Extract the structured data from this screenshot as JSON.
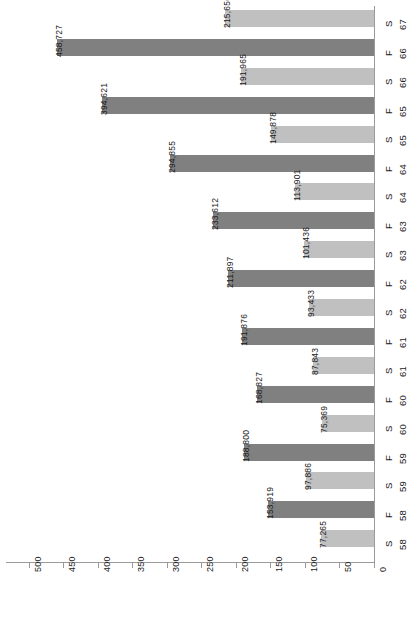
{
  "chart_data": {
    "type": "bar",
    "orientation": "horizontal-rotated",
    "title": "",
    "subtitle": "",
    "xlabel": "",
    "ylabel": "",
    "xlim": [
      0,
      500
    ],
    "grid": false,
    "legend": "none",
    "axis_ticks": [
      "0",
      "50",
      "100",
      "150",
      "200",
      "250",
      "300",
      "350",
      "400",
      "450",
      "500"
    ],
    "axis_tick_values": [
      0,
      50,
      100,
      150,
      200,
      250,
      300,
      350,
      400,
      450,
      500
    ],
    "axis_units": "thousands",
    "categories": [
      {
        "term": "S",
        "year": "67"
      },
      {
        "term": "F",
        "year": "66"
      },
      {
        "term": "S",
        "year": "66"
      },
      {
        "term": "F",
        "year": "65"
      },
      {
        "term": "S",
        "year": "65"
      },
      {
        "term": "F",
        "year": "64"
      },
      {
        "term": "S",
        "year": "64"
      },
      {
        "term": "F",
        "year": "63"
      },
      {
        "term": "S",
        "year": "63"
      },
      {
        "term": "F",
        "year": "62"
      },
      {
        "term": "S",
        "year": "62"
      },
      {
        "term": "F",
        "year": "61"
      },
      {
        "term": "S",
        "year": "61"
      },
      {
        "term": "F",
        "year": "60"
      },
      {
        "term": "S",
        "year": "60"
      },
      {
        "term": "F",
        "year": "59"
      },
      {
        "term": "S",
        "year": "59"
      },
      {
        "term": "F",
        "year": "58"
      },
      {
        "term": "S",
        "year": "58"
      }
    ],
    "bars": [
      {
        "category": "S 67",
        "series": "light",
        "value": 215.656,
        "label": "215,656"
      },
      {
        "category": "F 66",
        "series": "dark",
        "value": 458.727,
        "label": "458,727"
      },
      {
        "category": "S 66",
        "series": "light",
        "value": 191.965,
        "label": "191,965"
      },
      {
        "category": "F 65",
        "series": "dark",
        "value": 394.621,
        "label": "394,621"
      },
      {
        "category": "S 65",
        "series": "light",
        "value": 149.878,
        "label": "149,878"
      },
      {
        "category": "F 64",
        "series": "dark",
        "value": 294.855,
        "label": "294,855"
      },
      {
        "category": "S 64",
        "series": "light",
        "value": 113.901,
        "label": "113,901"
      },
      {
        "category": "F 63",
        "series": "dark",
        "value": 233.612,
        "label": "233,612"
      },
      {
        "category": "S 63",
        "series": "light",
        "value": 101.436,
        "label": "101,436"
      },
      {
        "category": "F 62",
        "series": "dark",
        "value": 211.897,
        "label": "211,897"
      },
      {
        "category": "S 62",
        "series": "light",
        "value": 93.433,
        "label": "93,433"
      },
      {
        "category": "F 61",
        "series": "dark",
        "value": 191.876,
        "label": "191,876"
      },
      {
        "category": "S 61",
        "series": "light",
        "value": 87.843,
        "label": "87,843"
      },
      {
        "category": "F 60",
        "series": "dark",
        "value": 168.827,
        "label": "168,827"
      },
      {
        "category": "S 60",
        "series": "light",
        "value": 75.369,
        "label": "75,369"
      },
      {
        "category": "F 59",
        "series": "dark",
        "value": 188.8,
        "label": "188,800"
      },
      {
        "category": "S 59",
        "series": "light",
        "value": 97.886,
        "label": "97,886"
      },
      {
        "category": "F 58",
        "series": "dark",
        "value": 153.919,
        "label": "153,919"
      },
      {
        "category": "S 58",
        "series": "light",
        "value": 77.265,
        "label": "77,265"
      }
    ],
    "colors": {
      "dark_series": "#808080",
      "light_series": "#c0c0c0",
      "axis": "#9a9a9a",
      "text": "#1a1a1a",
      "background": "#ffffff"
    }
  }
}
